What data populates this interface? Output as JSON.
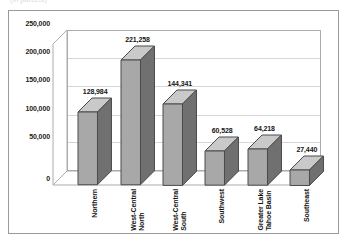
{
  "caption_fragment": "(in parcels)",
  "chart_data": {
    "type": "bar",
    "title": "",
    "subtitle": "",
    "xlabel": "",
    "ylabel": "",
    "categories": [
      "Northern",
      "West-Central\nNorth",
      "West-Central\nSouth",
      "Southwest",
      "Greater Lake\nTahoe Basin",
      "Southeast"
    ],
    "values": [
      128984,
      221258,
      144341,
      60528,
      64218,
      27440
    ],
    "data_labels": [
      "128,984",
      "221,258",
      "144,341",
      "60,528",
      "64,218",
      "27,440"
    ],
    "ylim": [
      0,
      250000
    ],
    "yticks": [
      0,
      50000,
      100000,
      150000,
      200000,
      250000
    ],
    "ytick_labels": [
      "0",
      "50,000",
      "100,000",
      "150,000",
      "200,000",
      "250,000"
    ],
    "grid": true,
    "legend": false,
    "three_d": true,
    "colors": {
      "bar_front": "#a8a8a8",
      "bar_side": "#707070",
      "bar_top": "#c9c9c9",
      "bar_outline": "#4a4a4a",
      "gridline": "#d6d6d6",
      "axis": "#acacac",
      "frame": "#9a9a9a",
      "text": "#141414",
      "background": "#ffffff"
    }
  }
}
